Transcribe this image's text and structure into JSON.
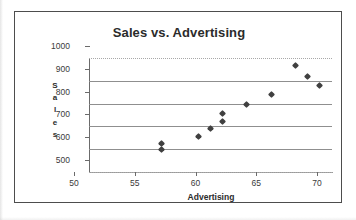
{
  "chart_data": {
    "type": "scatter",
    "title": "Sales vs. Advertising",
    "xlabel": "Advertising",
    "ylabel": "Sales",
    "ylabel_letters": [
      "S",
      "a",
      "l",
      "e",
      "s"
    ],
    "xlim": [
      50,
      70
    ],
    "ylim": [
      500,
      1000
    ],
    "xticks": [
      50,
      55,
      60,
      65,
      70
    ],
    "yticks": [
      500,
      600,
      700,
      800,
      900,
      1000
    ],
    "xtick_labels": [
      "50",
      "55",
      "60",
      "65",
      "70"
    ],
    "ytick_labels": [
      "500",
      "600",
      "700",
      "800",
      "900",
      "1000"
    ],
    "grid": "horizontal",
    "legend": "none",
    "marker": "diamond",
    "marker_color": "#404040",
    "points": [
      {
        "x": 56,
        "y": 598
      },
      {
        "x": 56,
        "y": 625
      },
      {
        "x": 59,
        "y": 657
      },
      {
        "x": 60,
        "y": 690
      },
      {
        "x": 61,
        "y": 723
      },
      {
        "x": 61,
        "y": 758
      },
      {
        "x": 63,
        "y": 798
      },
      {
        "x": 65,
        "y": 838
      },
      {
        "x": 67,
        "y": 968
      },
      {
        "x": 68,
        "y": 920
      },
      {
        "x": 69,
        "y": 880
      }
    ]
  },
  "colors": {
    "frame": "#4d4d4d",
    "gridline": "#8f8f8f",
    "axis": "#6b6b6b",
    "text": "#2b2b2b",
    "background": "#ffffff"
  }
}
